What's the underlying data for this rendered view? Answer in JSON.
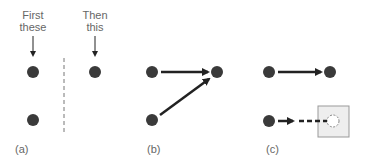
{
  "panel_a": {
    "label": "(a)",
    "caption_first_line1": "First",
    "caption_first_line2": "these",
    "caption_then_line1": "Then",
    "caption_then_line2": "this"
  },
  "panel_b": {
    "label": "(b)"
  },
  "panel_c": {
    "label": "(c)"
  },
  "colors": {
    "dot": "#3a3a3a",
    "arrow": "#222222",
    "dashed_divider": "#777777",
    "box_fill": "#eeeeee",
    "box_stroke": "#999999",
    "text": "#666666"
  }
}
